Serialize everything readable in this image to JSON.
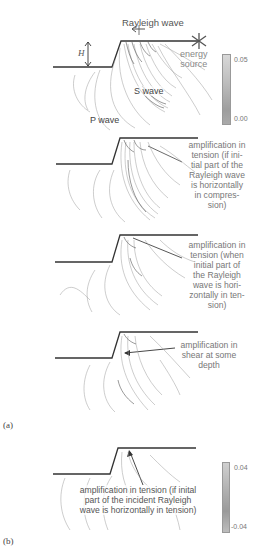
{
  "figure": {
    "panels": [
      {
        "id": "a1",
        "labels": {
          "rayleigh_wave": "Rayleigh wave",
          "energy_source": "energy\nsource",
          "height_symbol": "H",
          "s_wave": "S wave",
          "p_wave": "P wave"
        },
        "colorbar": {
          "max": "0.05",
          "min": "0.00"
        }
      },
      {
        "id": "a2",
        "annotation": "amplification in\ntension (if ini-\ntial part of the\nRayleigh wave\nis horizontally\nin compres-\nsion)"
      },
      {
        "id": "a3",
        "annotation": "amplification in\ntension (when\ninitial part of\nthe Rayleigh\nwave is hori-\nzontally in ten-\nsion)"
      },
      {
        "id": "a4",
        "annotation": "amplification in\nshear at some\ndepth"
      },
      {
        "id": "b",
        "annotation": "amplification in tension (if inital\npart of the incident Rayleigh\nwave is horizontally in tension)",
        "colorbar": {
          "max": "0.04",
          "min": "-0.04"
        }
      }
    ],
    "panel_tags": {
      "a": "(a)",
      "b": "(b)"
    },
    "colors": {
      "line": "#333333",
      "contour": "#9a9a9a",
      "text": "#777777"
    }
  }
}
